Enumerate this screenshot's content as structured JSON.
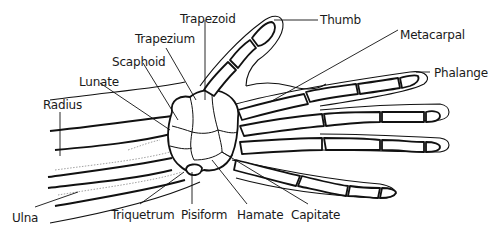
{
  "diagram": {
    "labels": {
      "trapezoid": "Trapezoid",
      "thumb": "Thumb",
      "trapezium": "Trapezium",
      "metacarpal": "Metacarpal",
      "scaphoid": "Scaphoid",
      "phalange": "Phalange",
      "lunate": "Lunate",
      "radius": "Radius",
      "ulna": "Ulna",
      "triquetrum": "Triquetrum",
      "pisiform": "Pisiform",
      "hamate": "Hamate",
      "capitate": "Capitate"
    },
    "colors": {
      "line": "#111111",
      "background": "#ffffff",
      "text": "#1a1a1a"
    }
  }
}
